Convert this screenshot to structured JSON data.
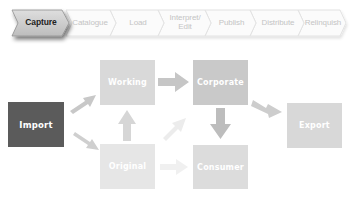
{
  "process_steps": [
    {
      "label": "Capture",
      "active": true
    },
    {
      "label": "Catalogue",
      "active": false
    },
    {
      "label": "Load",
      "active": false
    },
    {
      "label": "Interpret/ Edit",
      "active": false
    },
    {
      "label": "Publish",
      "active": false
    },
    {
      "label": "Distribute",
      "active": false
    },
    {
      "label": "Relinquish",
      "active": false
    }
  ],
  "nodes": {
    "import": {
      "label": "Import",
      "color": "#5b5b5b"
    },
    "working": {
      "label": "Working",
      "color": "#d9d9d9"
    },
    "original": {
      "label": "Original",
      "color": "#e6e6e6"
    },
    "corporate": {
      "label": "Corporate",
      "color": "#c9c9c9"
    },
    "consumer": {
      "label": "Consumer",
      "color": "#dcdcdc"
    },
    "export": {
      "label": "Export",
      "color": "#d8d8d8"
    }
  },
  "edges": [
    {
      "from": "Import",
      "to": "Working"
    },
    {
      "from": "Import",
      "to": "Original"
    },
    {
      "from": "Original",
      "to": "Working"
    },
    {
      "from": "Working",
      "to": "Corporate"
    },
    {
      "from": "Original",
      "to": "Corporate"
    },
    {
      "from": "Corporate",
      "to": "Consumer"
    },
    {
      "from": "Corporate",
      "to": "Export"
    },
    {
      "from": "Original",
      "to": "Consumer"
    }
  ]
}
